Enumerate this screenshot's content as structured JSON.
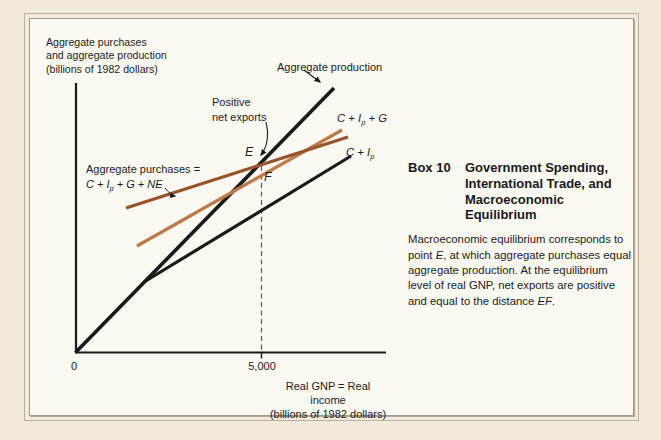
{
  "page": {
    "bg": "#f0ebdb",
    "panel_bg": "#fbf9f2",
    "border_outer": "#c6ab99",
    "border_inner": "#a49888"
  },
  "chart": {
    "y_axis_label": "Aggregate purchases\nand aggregate production\n(billions of 1982 dollars)",
    "production_label": "Aggregate production",
    "net_exports_label": "Positive\nnet exports",
    "point_e_label": "E",
    "point_f_label": "F",
    "origin_label": "0",
    "x_tick_label": "5,000",
    "x_axis_label": "Real GNP = Real income\n(billions of 1982 dollars)",
    "purchases_line_label_segments": [
      {
        "t": "Aggregate purchases =\n"
      },
      {
        "t": "C + I",
        "i": true
      },
      {
        "t": "p",
        "i": true,
        "sub": true
      },
      {
        "t": " + G + NE",
        "i": true
      }
    ],
    "c_ip_g_label_segments": [
      {
        "t": "C + I",
        "i": true
      },
      {
        "t": "p",
        "i": true,
        "sub": true
      },
      {
        "t": " + G",
        "i": true
      }
    ],
    "c_ip_label_segments": [
      {
        "t": "C + I",
        "i": true
      },
      {
        "t": "p",
        "i": true,
        "sub": true
      }
    ],
    "colors": {
      "black_line": "#1a1a1a",
      "c_ip_g_line": "#bd7a4a",
      "purchases_line": "#96532c",
      "dashed_line": "#5a5a5a"
    }
  },
  "box": {
    "label": "Box 10",
    "title": "Government Spending,\nInternational Trade, and\nMacroeconomic Equilibrium",
    "body_segments": [
      {
        "t": "Macroeconomic equilibrium corresponds to\npoint "
      },
      {
        "t": "E",
        "i": true
      },
      {
        "t": ", at which aggregate purchases equal\naggregate production.  At the equilibrium\nlevel of real GNP, net exports are positive\nand equal to the distance "
      },
      {
        "t": "EF",
        "i": true
      },
      {
        "t": "."
      }
    ]
  },
  "chart_data": {
    "type": "line",
    "title": "Box 10  Government Spending, International Trade, and Macroeconomic Equilibrium",
    "xlabel": "Real GNP = Real income (billions of 1982 dollars)",
    "ylabel": "Aggregate purchases and aggregate production (billions of 1982 dollars)",
    "xlim": [
      0,
      8350
    ],
    "ylim": [
      0,
      7150
    ],
    "x_ticks": [
      0,
      5000
    ],
    "grid": false,
    "legend_position": "inline-labels",
    "series": [
      {
        "name": "Aggregate production",
        "color": "#1a1a1a",
        "points": [
          [
            0,
            0
          ],
          [
            7000,
            7000
          ]
        ]
      },
      {
        "name": "C + Ip",
        "color": "#1a1a1a",
        "points": [
          [
            1850,
            1880
          ],
          [
            7400,
            5200
          ]
        ]
      },
      {
        "name": "C + Ip + G",
        "color": "#bd7a4a",
        "points": [
          [
            1650,
            2850
          ],
          [
            7150,
            5900
          ]
        ]
      },
      {
        "name": "Aggregate purchases = C + Ip + G + NE",
        "color": "#96532c",
        "points": [
          [
            1350,
            3850
          ],
          [
            7350,
            5700
          ]
        ]
      }
    ],
    "annotations": [
      {
        "label": "E",
        "x": 5000,
        "y": 5000,
        "meaning": "macroeconomic equilibrium, purchases line crosses production line"
      },
      {
        "label": "F",
        "x": 5000,
        "y": 4680,
        "meaning": "point on C + Ip + G line below E"
      },
      {
        "label": "Positive net exports",
        "meaning": "distance EF at real GNP = 5,000"
      },
      {
        "label": "dashed vertical guide line at x = 5,000"
      }
    ]
  }
}
